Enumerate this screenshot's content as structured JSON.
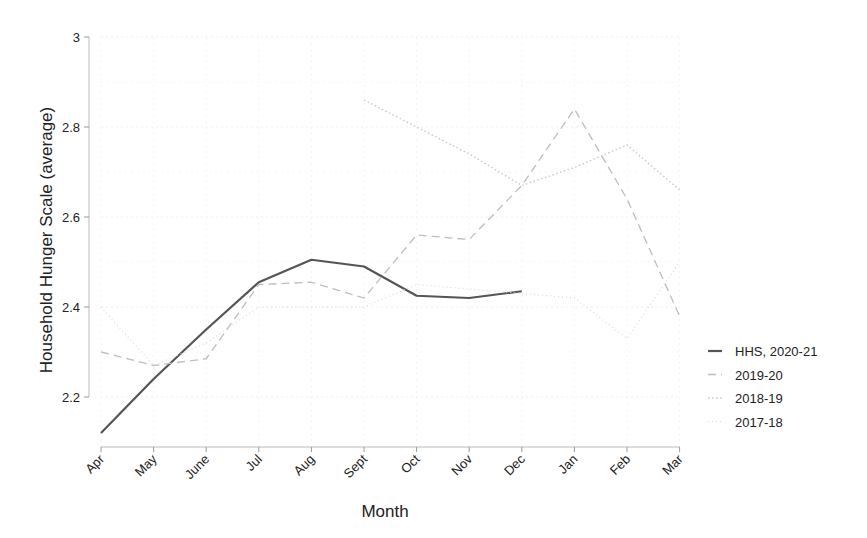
{
  "chart_data": {
    "type": "line",
    "title": "",
    "xlabel": "Month",
    "ylabel": "Household Hunger Scale (average)",
    "ylim": [
      2.1,
      3.0
    ],
    "yticks": [
      2.2,
      2.4,
      2.6,
      2.8,
      3
    ],
    "ytick_labels": [
      "2.2",
      "2.4",
      "2.6",
      "2.8",
      "3"
    ],
    "grid": true,
    "legend_position": "right",
    "categories": [
      "Apr",
      "May",
      "June",
      "Jul",
      "Aug",
      "Sept",
      "Oct",
      "Nov",
      "Dec",
      "Jan",
      "Feb",
      "Mar"
    ],
    "series": [
      {
        "name": "HHS, 2020-21",
        "style": "solid",
        "color": "#555555",
        "values": [
          2.12,
          2.24,
          2.35,
          2.455,
          2.505,
          2.49,
          2.425,
          2.42,
          2.435,
          null,
          null,
          null
        ]
      },
      {
        "name": "2019-20",
        "style": "dashed",
        "color": "#bdbdbd",
        "values": [
          2.3,
          2.27,
          2.285,
          2.45,
          2.455,
          2.42,
          2.56,
          2.55,
          2.67,
          2.84,
          2.64,
          2.38
        ]
      },
      {
        "name": "2018-19",
        "style": "dotted",
        "color": "#c8c8c8",
        "values": [
          null,
          null,
          null,
          null,
          null,
          2.86,
          2.8,
          2.74,
          2.67,
          2.71,
          2.76,
          2.66
        ]
      },
      {
        "name": "2017-18",
        "style": "dotted-fine",
        "color": "#d8d8d8",
        "values": [
          2.4,
          2.27,
          2.32,
          2.4,
          2.4,
          2.4,
          2.45,
          2.44,
          2.43,
          2.42,
          2.33,
          2.5
        ]
      }
    ]
  }
}
